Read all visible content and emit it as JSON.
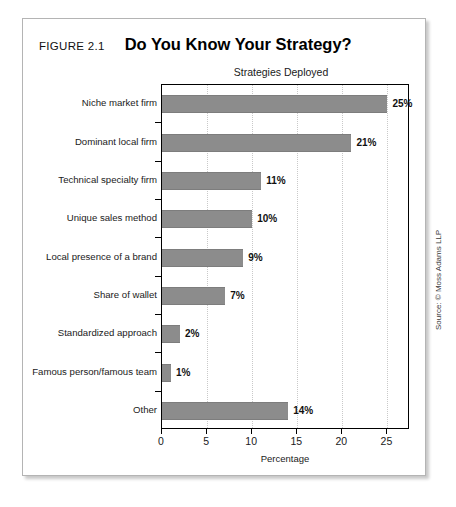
{
  "figure": {
    "number_label": "FIGURE 2.1",
    "title": "Do You Know Your Strategy?",
    "source": "Source: © Moss Adams LLP"
  },
  "chart_data": {
    "type": "bar",
    "orientation": "horizontal",
    "title": "Strategies Deployed",
    "xlabel": "Percentage",
    "ylabel": "",
    "xlim": [
      0,
      27.5
    ],
    "xticks": [
      0,
      5,
      10,
      15,
      20,
      25
    ],
    "xticklabels": [
      "0",
      "5",
      "10",
      "15",
      "20",
      "25"
    ],
    "grid": "vertical-dotted",
    "legend": "none",
    "bar_color": "#8c8c8c",
    "categories": [
      "Niche market firm",
      "Dominant local firm",
      "Technical specialty firm",
      "Unique sales method",
      "Local presence of a brand",
      "Share of wallet",
      "Standardized approach",
      "Famous person/famous team",
      "Other"
    ],
    "values": [
      25,
      21,
      11,
      10,
      9,
      7,
      2,
      1,
      14
    ],
    "data_labels": [
      "25%",
      "21%",
      "11%",
      "10%",
      "9%",
      "7%",
      "2%",
      "1%",
      "14%"
    ]
  }
}
